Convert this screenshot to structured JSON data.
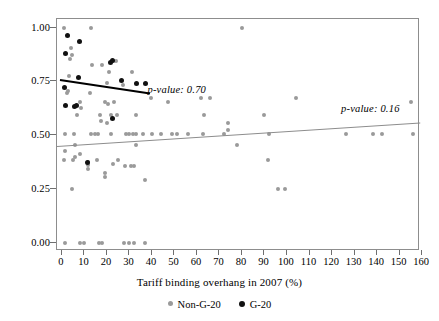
{
  "chart_data": {
    "type": "scatter",
    "title": "",
    "xlabel": "Tariff binding overhang in 2007 (%)",
    "ylabel": "",
    "xlim": [
      -2.2,
      159.1
    ],
    "ylim": [
      -0.0375,
      1.04
    ],
    "grid": false,
    "xticks": [
      0,
      10,
      20,
      30,
      40,
      50,
      60,
      70,
      80,
      90,
      100,
      110,
      120,
      130,
      140,
      150,
      160
    ],
    "xtick_labels": [
      "0",
      "10",
      "20",
      "30",
      "40",
      "50",
      "60",
      "70",
      "80",
      "90",
      "100",
      "110",
      "120",
      "130",
      "140",
      "150",
      "160"
    ],
    "yticks": [
      0.0,
      0.25,
      0.5,
      0.75,
      1.0
    ],
    "ytick_labels": [
      "0.00",
      "0.25",
      "0.50",
      "0.75",
      "1.00"
    ],
    "legend_position": "bottom-center",
    "annotations": [
      {
        "name": "g20-pvalue",
        "text": "p-value: 0.70",
        "x": 38.0,
        "y": 0.705
      },
      {
        "name": "nong20-pvalue",
        "text": "p-value: 0.16",
        "x": 124.0,
        "y": 0.617
      }
    ],
    "series": [
      {
        "name": "Non-G-20",
        "color": "#9a9a9a",
        "marker": "circle",
        "points": [
          [
            1.0,
            1.0
          ],
          [
            13.0,
            1.0
          ],
          [
            80.0,
            1.0
          ],
          [
            4.0,
            0.905
          ],
          [
            4.3,
            0.875
          ],
          [
            3.6,
            0.855
          ],
          [
            13.5,
            0.825
          ],
          [
            18.0,
            0.825
          ],
          [
            22.5,
            0.845
          ],
          [
            24.0,
            0.845
          ],
          [
            21.0,
            0.795
          ],
          [
            31.0,
            0.795
          ],
          [
            3.0,
            0.775
          ],
          [
            20.0,
            0.745
          ],
          [
            27.0,
            0.735
          ],
          [
            2.5,
            0.705
          ],
          [
            2.2,
            0.695
          ],
          [
            12.5,
            0.695
          ],
          [
            39.5,
            0.675
          ],
          [
            62.0,
            0.675
          ],
          [
            66.0,
            0.675
          ],
          [
            104.0,
            0.675
          ],
          [
            8.0,
            0.655
          ],
          [
            19.0,
            0.655
          ],
          [
            23.0,
            0.655
          ],
          [
            8.3,
            0.625
          ],
          [
            20.5,
            0.645
          ],
          [
            47.0,
            0.655
          ],
          [
            6.5,
            0.595
          ],
          [
            17.0,
            0.595
          ],
          [
            22.0,
            0.595
          ],
          [
            24.5,
            0.595
          ],
          [
            33.0,
            0.595
          ],
          [
            63.0,
            0.595
          ],
          [
            90.0,
            0.595
          ],
          [
            155.0,
            0.655
          ],
          [
            17.5,
            0.565
          ],
          [
            20.0,
            0.555
          ],
          [
            1.5,
            0.505
          ],
          [
            5.5,
            0.505
          ],
          [
            13.0,
            0.505
          ],
          [
            14.5,
            0.505
          ],
          [
            16.0,
            0.505
          ],
          [
            22.0,
            0.505
          ],
          [
            28.5,
            0.505
          ],
          [
            30.0,
            0.505
          ],
          [
            31.5,
            0.505
          ],
          [
            33.0,
            0.505
          ],
          [
            36.0,
            0.505
          ],
          [
            40.0,
            0.505
          ],
          [
            44.0,
            0.505
          ],
          [
            49.0,
            0.505
          ],
          [
            51.0,
            0.505
          ],
          [
            56.0,
            0.505
          ],
          [
            62.5,
            0.505
          ],
          [
            72.0,
            0.505
          ],
          [
            92.0,
            0.505
          ],
          [
            126.0,
            0.505
          ],
          [
            138.0,
            0.505
          ],
          [
            142.0,
            0.505
          ],
          [
            156.0,
            0.505
          ],
          [
            74.0,
            0.555
          ],
          [
            74.0,
            0.525
          ],
          [
            6.0,
            0.455
          ],
          [
            33.0,
            0.455
          ],
          [
            78.0,
            0.455
          ],
          [
            1.5,
            0.425
          ],
          [
            8.0,
            0.415
          ],
          [
            1.0,
            0.385
          ],
          [
            5.0,
            0.385
          ],
          [
            15.5,
            0.385
          ],
          [
            25.0,
            0.385
          ],
          [
            91.5,
            0.385
          ],
          [
            5.8,
            0.4
          ],
          [
            11.5,
            0.375
          ],
          [
            11.5,
            0.36
          ],
          [
            11.5,
            0.345
          ],
          [
            28.0,
            0.355
          ],
          [
            30.5,
            0.355
          ],
          [
            32.0,
            0.355
          ],
          [
            22.5,
            0.365
          ],
          [
            19.0,
            0.325
          ],
          [
            19.0,
            0.305
          ],
          [
            37.0,
            0.29
          ],
          [
            4.5,
            0.25
          ],
          [
            96.0,
            0.25
          ],
          [
            99.0,
            0.25
          ],
          [
            1.5,
            0.0
          ],
          [
            8.0,
            0.0
          ],
          [
            10.0,
            0.0
          ],
          [
            16.5,
            0.0
          ],
          [
            18.0,
            0.0
          ],
          [
            27.5,
            0.0
          ],
          [
            30.0,
            0.0
          ],
          [
            32.0,
            0.0
          ],
          [
            37.0,
            0.0
          ]
        ],
        "trend": {
          "x0": -2.2,
          "y0": 0.448,
          "x1": 159.1,
          "y1": 0.557
        }
      },
      {
        "name": "G-20",
        "color": "#111111",
        "marker": "circle",
        "points": [
          [
            2.5,
            0.965
          ],
          [
            8.0,
            0.935
          ],
          [
            1.5,
            0.88
          ],
          [
            7.5,
            0.77
          ],
          [
            21.5,
            0.84
          ],
          [
            22.5,
            0.845
          ],
          [
            26.5,
            0.755
          ],
          [
            33.0,
            0.74
          ],
          [
            37.0,
            0.74
          ],
          [
            1.2,
            0.72
          ],
          [
            1.5,
            0.64
          ],
          [
            5.5,
            0.635
          ],
          [
            6.5,
            0.64
          ],
          [
            22.5,
            0.58
          ],
          [
            11.5,
            0.375
          ]
        ],
        "trend": {
          "x0": -0.8,
          "y0": 0.762,
          "x1": 39.0,
          "y1": 0.7
        }
      }
    ]
  },
  "legend": {
    "entries": [
      {
        "label": "Non-G-20",
        "swatch": "nong20",
        "icon": "dot-icon"
      },
      {
        "label": "G-20",
        "swatch": "g20",
        "icon": "dot-icon"
      }
    ]
  }
}
